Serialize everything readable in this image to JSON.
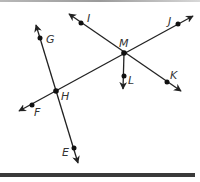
{
  "diagram": {
    "type": "geometry-lines-and-rays",
    "colors": {
      "stroke": "#222222",
      "label": "#333333",
      "rule": "#3a3a3a"
    },
    "points": [
      {
        "id": "G",
        "label": "G",
        "x": 40,
        "y": 38,
        "label_x": 46,
        "label_y": 43
      },
      {
        "id": "I",
        "label": "I",
        "x": 81,
        "y": 23,
        "label_x": 87,
        "label_y": 22
      },
      {
        "id": "M",
        "label": "M",
        "x": 124,
        "y": 53,
        "label_x": 119,
        "label_y": 47
      },
      {
        "id": "J",
        "label": "J",
        "x": 178,
        "y": 24,
        "label_x": 168,
        "label_y": 25
      },
      {
        "id": "L",
        "label": "L",
        "x": 124,
        "y": 76,
        "label_x": 128,
        "label_y": 84
      },
      {
        "id": "K",
        "label": "K",
        "x": 167,
        "y": 82,
        "label_x": 170,
        "label_y": 79
      },
      {
        "id": "H",
        "label": "H",
        "x": 56,
        "y": 91,
        "label_x": 61,
        "label_y": 100
      },
      {
        "id": "F",
        "label": "F",
        "x": 32,
        "y": 105,
        "label_x": 34,
        "label_y": 116
      },
      {
        "id": "E",
        "label": "E",
        "x": 74,
        "y": 148,
        "label_x": 62,
        "label_y": 156
      }
    ],
    "lines": [
      {
        "name": "line-GE",
        "through": [
          "G",
          "H",
          "E"
        ],
        "x1": 36,
        "y1": 25,
        "x2": 78,
        "y2": 163
      },
      {
        "name": "line-FJ",
        "through": [
          "F",
          "H",
          "M",
          "J"
        ],
        "x1": 19,
        "y1": 111,
        "x2": 193,
        "y2": 16
      },
      {
        "name": "line-IK",
        "through": [
          "I",
          "M",
          "K"
        ],
        "x1": 69,
        "y1": 14,
        "x2": 181,
        "y2": 91
      }
    ],
    "rays": [
      {
        "name": "ray-ML",
        "from": "M",
        "through": "L",
        "x1": 124,
        "y1": 53,
        "x2": 123,
        "y2": 89
      }
    ]
  }
}
